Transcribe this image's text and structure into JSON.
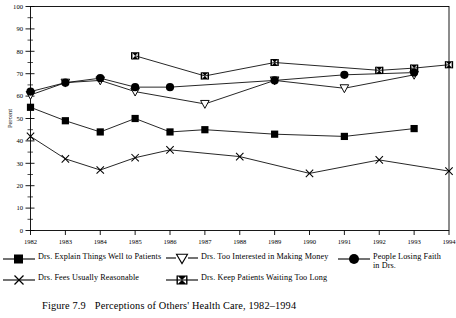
{
  "figure": {
    "caption_number": "Figure 7.9",
    "caption_text": "Perceptions of Others' Health Care, 1982–1994"
  },
  "axes": {
    "ylabel": "Percent",
    "ylim": [
      0,
      100
    ],
    "ytick_step": 10,
    "yminor_step": 5,
    "yticks": [
      "0",
      "10",
      "20",
      "30",
      "40",
      "50",
      "60",
      "70",
      "80",
      "90",
      "100"
    ],
    "xticks": [
      "1982",
      "1983",
      "1984",
      "1985",
      "1986",
      "1987",
      "1988",
      "1989",
      "1990",
      "1991",
      "1992",
      "1993",
      "1994"
    ],
    "grid": false,
    "frame": "box"
  },
  "legend": {
    "position": "below-axes",
    "entries": [
      {
        "label": "Drs. Explain Things Well to Patients",
        "marker": "filled-square-icon"
      },
      {
        "label": "Drs. Too Interested in Making Money",
        "marker": "open-down-triangle-icon"
      },
      {
        "label": "People Losing Faith in Drs.",
        "marker": "filled-circle-icon"
      },
      {
        "label": "Drs. Fees Usually Reasonable",
        "marker": "x-cross-icon"
      },
      {
        "label": "Drs. Keep Patients Waiting Too Long",
        "marker": "bowtie-icon"
      }
    ]
  },
  "chart_data": {
    "type": "line",
    "title": "Perceptions of Others' Health Care, 1982–1994",
    "xlabel": "",
    "ylabel": "Percent",
    "ylim": [
      0,
      100
    ],
    "x": [
      1982,
      1983,
      1984,
      1985,
      1986,
      1987,
      1988,
      1989,
      1990,
      1991,
      1992,
      1993,
      1994
    ],
    "series": [
      {
        "name": "Drs. Explain Things Well to Patients",
        "marker": "filled-square-icon",
        "color": "#000000",
        "points": [
          {
            "x": 1982,
            "y": 55
          },
          {
            "x": 1983,
            "y": 49
          },
          {
            "x": 1984,
            "y": 44
          },
          {
            "x": 1985,
            "y": 50
          },
          {
            "x": 1986,
            "y": 44
          },
          {
            "x": 1987,
            "y": 45
          },
          {
            "x": 1989,
            "y": 43
          },
          {
            "x": 1991,
            "y": 42
          },
          {
            "x": 1993,
            "y": 45.5
          }
        ]
      },
      {
        "name": "Drs. Too Interested in Making Money",
        "marker": "open-down-triangle-icon",
        "color": "#000000",
        "points": [
          {
            "x": 1982,
            "y": 60.5
          },
          {
            "x": 1983,
            "y": 66
          },
          {
            "x": 1984,
            "y": 67
          },
          {
            "x": 1985,
            "y": 62
          },
          {
            "x": 1987,
            "y": 56.5
          },
          {
            "x": 1989,
            "y": 67
          },
          {
            "x": 1991,
            "y": 63.5
          },
          {
            "x": 1993,
            "y": 69.5
          }
        ]
      },
      {
        "name": "People Losing Faith in Drs.",
        "marker": "filled-circle-icon",
        "color": "#000000",
        "points": [
          {
            "x": 1982,
            "y": 62
          },
          {
            "x": 1983,
            "y": 66
          },
          {
            "x": 1984,
            "y": 68
          },
          {
            "x": 1985,
            "y": 64
          },
          {
            "x": 1986,
            "y": 64
          },
          {
            "x": 1989,
            "y": 67
          },
          {
            "x": 1991,
            "y": 69.5
          },
          {
            "x": 1993,
            "y": 70.5
          }
        ]
      },
      {
        "name": "Drs. Fees Usually Reasonable",
        "marker": "x-cross-icon",
        "color": "#000000",
        "points": [
          {
            "x": 1982,
            "y": 42
          },
          {
            "x": 1983,
            "y": 32
          },
          {
            "x": 1984,
            "y": 27
          },
          {
            "x": 1985,
            "y": 32.5
          },
          {
            "x": 1986,
            "y": 36
          },
          {
            "x": 1988,
            "y": 33
          },
          {
            "x": 1990,
            "y": 25.5
          },
          {
            "x": 1992,
            "y": 31.5
          },
          {
            "x": 1994,
            "y": 26.5
          }
        ]
      },
      {
        "name": "Drs. Keep Patients Waiting Too Long",
        "marker": "bowtie-icon",
        "color": "#000000",
        "points": [
          {
            "x": 1985,
            "y": 78
          },
          {
            "x": 1987,
            "y": 69
          },
          {
            "x": 1989,
            "y": 75
          },
          {
            "x": 1992,
            "y": 71.5
          },
          {
            "x": 1994,
            "y": 74
          },
          {
            "x": 1993,
            "y": 72.5
          }
        ]
      }
    ]
  }
}
